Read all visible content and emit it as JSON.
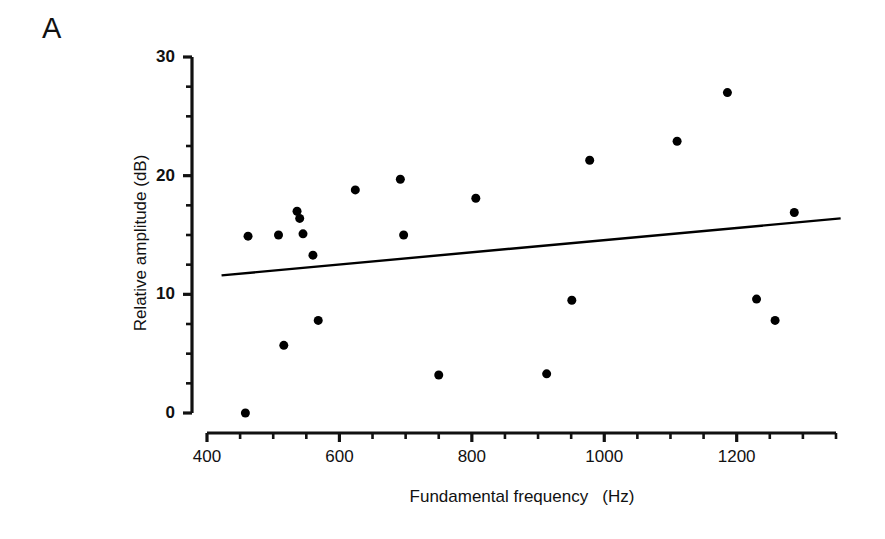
{
  "figure": {
    "panel_label": "A",
    "background_color": "#ffffff",
    "ink_color": "#111111"
  },
  "chart_data": {
    "type": "scatter",
    "title": "",
    "panel": "A",
    "xlabel": "Fundamental frequency   (Hz)",
    "ylabel": "Relative amplitude (dB)",
    "xlim": [
      400,
      1350
    ],
    "ylim": [
      0,
      30
    ],
    "xticks_major": [
      400,
      600,
      800,
      1000,
      1200
    ],
    "xtick_labels": [
      "400",
      "600",
      "800",
      "1000",
      "1200"
    ],
    "xticks_minor_step": 50,
    "yticks_major": [
      0,
      10,
      20,
      30
    ],
    "ytick_labels": [
      "0",
      "10",
      "20",
      "30"
    ],
    "yticks_minor_step": 2.5,
    "grid": false,
    "legend": "none",
    "marker": {
      "shape": "circle",
      "color": "#000000",
      "size_px": 9
    },
    "points": [
      {
        "x": 458,
        "y": 0.0
      },
      {
        "x": 462,
        "y": 14.9
      },
      {
        "x": 508,
        "y": 15.0
      },
      {
        "x": 516,
        "y": 5.7
      },
      {
        "x": 536,
        "y": 17.0
      },
      {
        "x": 540,
        "y": 16.4
      },
      {
        "x": 545,
        "y": 15.1
      },
      {
        "x": 560,
        "y": 13.3
      },
      {
        "x": 568,
        "y": 7.8
      },
      {
        "x": 624,
        "y": 18.8
      },
      {
        "x": 692,
        "y": 19.7
      },
      {
        "x": 697,
        "y": 15.0
      },
      {
        "x": 750,
        "y": 3.2
      },
      {
        "x": 806,
        "y": 18.1
      },
      {
        "x": 913,
        "y": 3.3
      },
      {
        "x": 951,
        "y": 9.5
      },
      {
        "x": 978,
        "y": 21.3
      },
      {
        "x": 1110,
        "y": 22.9
      },
      {
        "x": 1186,
        "y": 27.0
      },
      {
        "x": 1230,
        "y": 9.6
      },
      {
        "x": 1258,
        "y": 7.8
      },
      {
        "x": 1287,
        "y": 16.9
      }
    ],
    "regression_line": {
      "type": "line",
      "color": "#000000",
      "x_start": 422,
      "y_start": 11.6,
      "x_end": 1357,
      "y_end": 16.4
    }
  }
}
